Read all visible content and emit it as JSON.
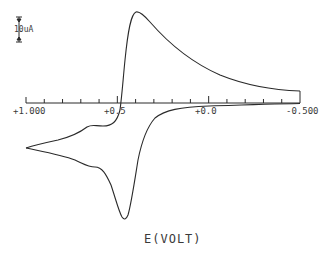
{
  "chart_data": {
    "type": "line",
    "title": "",
    "xlabel": "E(VOLT)",
    "ylabel": "",
    "x_direction": "decreasing (left +1.000 to right -0.500)",
    "xlim": [
      1.0,
      -0.5
    ],
    "x_tick_labels": [
      "+1.000",
      "+0.5",
      "+0.0",
      "-0.500"
    ],
    "x_tick_spacing": 0.1,
    "grid": false,
    "legend": null,
    "current_scale_bar": {
      "label": "10uA",
      "value_uA": 10
    },
    "annotations": [
      "Cyclic voltammogram; anodic peak near +0.40 V, cathodic peak near +0.46 V, shoulders near +0.62 V"
    ],
    "series": [
      {
        "name": "forward scan (anodic, upper branch)",
        "x": [
          -0.5,
          -0.4,
          -0.3,
          -0.2,
          -0.1,
          0.0,
          0.1,
          0.2,
          0.3,
          0.35,
          0.4,
          0.43,
          0.47,
          0.53,
          0.6,
          0.65,
          0.75,
          0.85,
          1.0
        ],
        "y_uA": [
          4.8,
          5.6,
          6.4,
          7.4,
          8.8,
          10.5,
          13.0,
          16.8,
          23.5,
          28.5,
          35.5,
          33.0,
          12.0,
          -5.0,
          -8.8,
          -10.0,
          -12.6,
          -14.5,
          -18.0
        ]
      },
      {
        "name": "reverse scan (cathodic, lower branch)",
        "x": [
          1.0,
          0.9,
          0.8,
          0.7,
          0.65,
          0.6,
          0.55,
          0.5,
          0.47,
          0.44,
          0.4,
          0.35,
          0.3,
          0.2,
          0.1,
          0.0,
          -0.2,
          -0.5
        ],
        "y_uA": [
          -18.0,
          -22.5,
          -25.0,
          -26.0,
          -26.5,
          -30.0,
          -37.0,
          -45.0,
          -46.5,
          -40.0,
          -23.0,
          -10.5,
          -5.0,
          -2.4,
          -1.6,
          -1.2,
          -0.6,
          -0.2
        ]
      }
    ]
  },
  "labels": {
    "scale_bar": "10uA",
    "xlabel": "E(VOLT)",
    "ticks": [
      "+1.000",
      "+0.5",
      "+0.0",
      "-0.500"
    ]
  },
  "colors": {
    "line": "#2a2a2a",
    "text": "#3a3a3a",
    "background": "#ffffff"
  }
}
